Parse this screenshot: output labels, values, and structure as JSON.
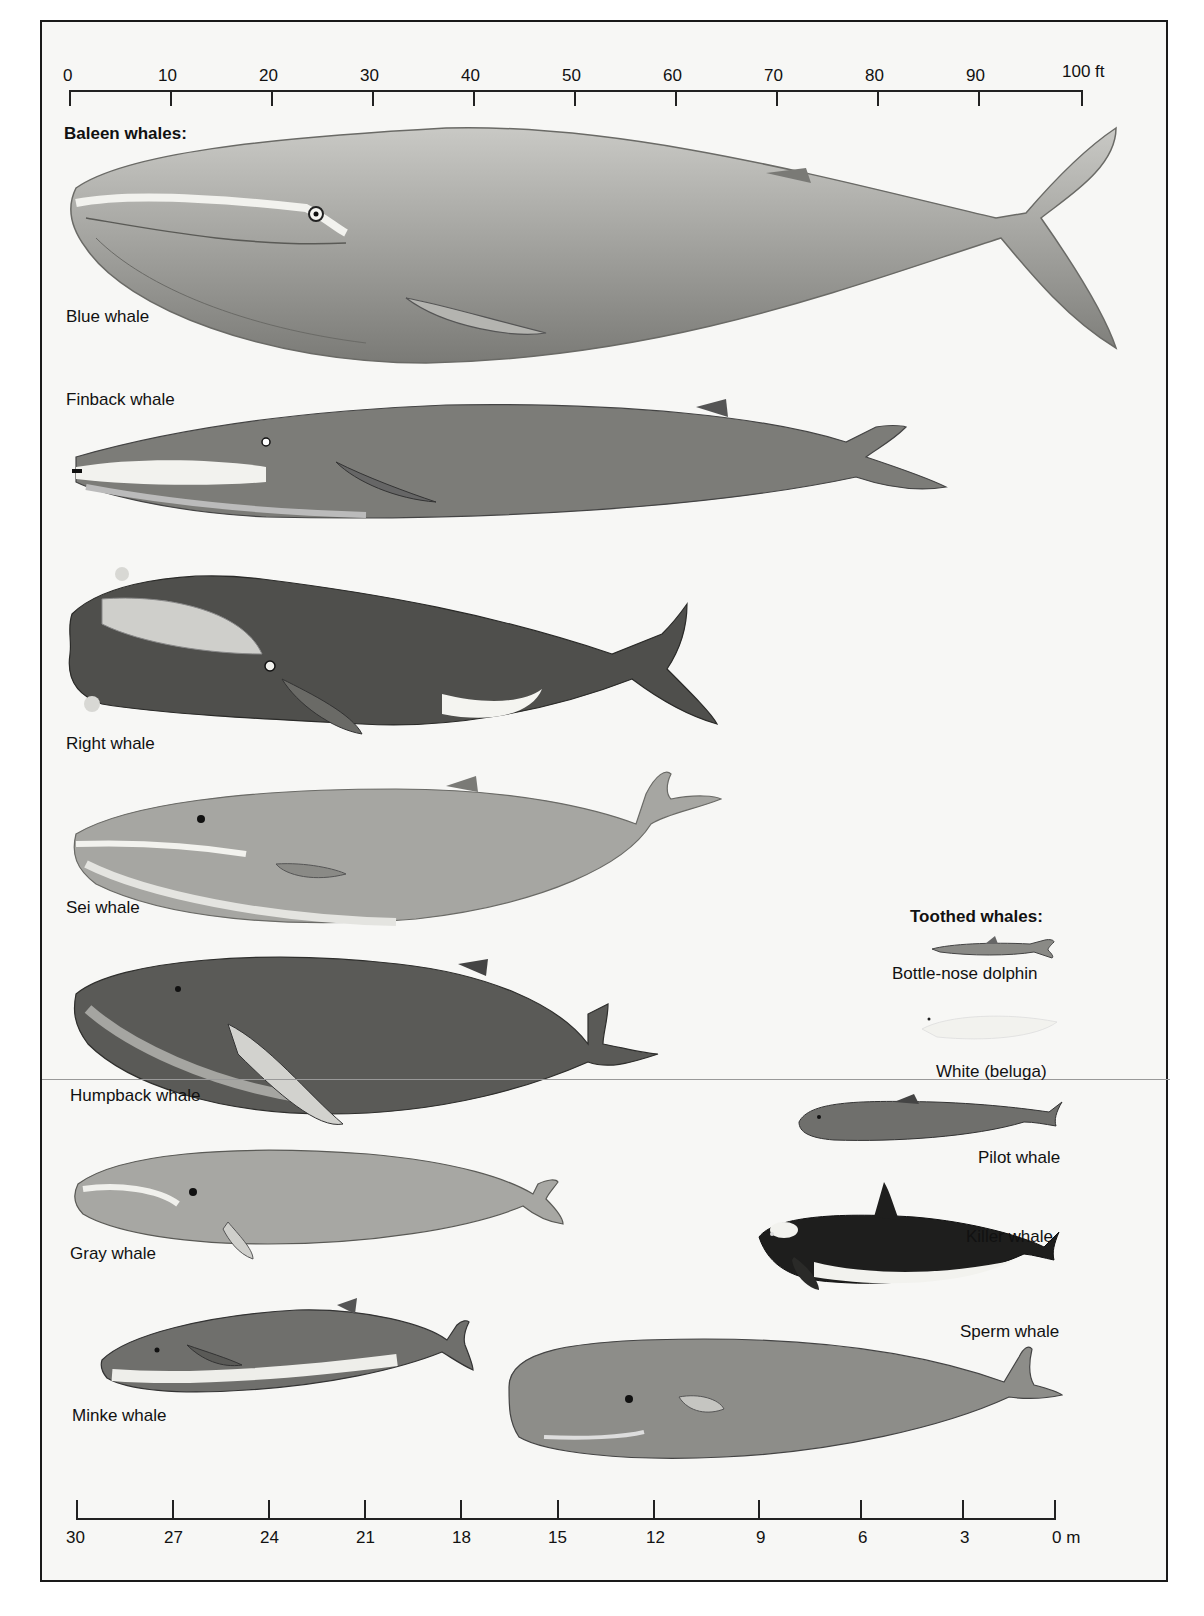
{
  "figure": {
    "top_scale": {
      "unit": "ft",
      "ticks": [
        "0",
        "10",
        "20",
        "30",
        "40",
        "50",
        "60",
        "70",
        "80",
        "90",
        "100 ft"
      ]
    },
    "bottom_scale": {
      "unit": "m",
      "ticks": [
        "30",
        "27",
        "24",
        "21",
        "18",
        "15",
        "12",
        "9",
        "6",
        "3",
        "0 m"
      ]
    },
    "baleen_title": "Baleen whales:",
    "toothed_title": "Toothed whales:",
    "baleen_whales": [
      {
        "label": "Blue whale"
      },
      {
        "label": "Finback whale"
      },
      {
        "label": "Right whale"
      },
      {
        "label": "Sei whale"
      },
      {
        "label": "Humpback whale"
      },
      {
        "label": "Gray whale"
      },
      {
        "label": "Minke whale"
      }
    ],
    "toothed_whales": [
      {
        "label": "Bottle-nose dolphin"
      },
      {
        "label": "White (beluga)"
      },
      {
        "label": "Pilot whale"
      },
      {
        "label": "Killer whale"
      },
      {
        "label": "Sperm whale"
      }
    ],
    "colors": {
      "background": "#f7f7f5",
      "frame": "#1a1a1a",
      "whale_light": "#b8b8b4",
      "whale_mid": "#8c8c88",
      "whale_dark": "#4a4a48",
      "belly": "#e8e8e4"
    }
  }
}
